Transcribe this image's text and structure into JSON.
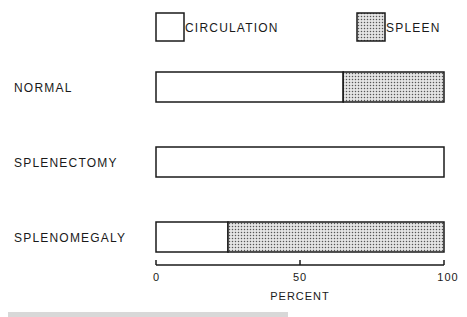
{
  "chart_data": {
    "type": "bar",
    "orientation": "horizontal",
    "stacked": true,
    "title": "",
    "xlabel": "PERCENT",
    "ylabel": "",
    "xlim": [
      0,
      100
    ],
    "xticks": [
      0,
      50,
      100
    ],
    "xtick_labels": [
      "0",
      "50",
      "100"
    ],
    "grid": false,
    "legend_position": "top",
    "categories": [
      "NORMAL",
      "SPLENECTOMY",
      "SPLENOMEGALY"
    ],
    "series": [
      {
        "name": "CIRCULATION",
        "pattern": "blank",
        "values": [
          65,
          100,
          25
        ]
      },
      {
        "name": "SPLEEN",
        "pattern": "stippled",
        "values": [
          35,
          0,
          75
        ]
      }
    ]
  },
  "colors": {
    "ink": "#1a1a1a",
    "stipple": "#6a6a6a",
    "background": "#ffffff"
  }
}
